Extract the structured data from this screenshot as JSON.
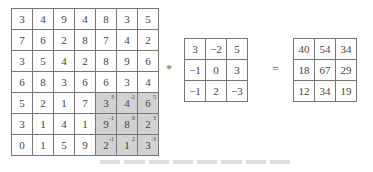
{
  "input_matrix": {
    "rows": [
      [
        3,
        4,
        9,
        4,
        8,
        3,
        5
      ],
      [
        7,
        6,
        2,
        8,
        7,
        4,
        2
      ],
      [
        3,
        5,
        4,
        2,
        8,
        9,
        6
      ],
      [
        6,
        8,
        3,
        6,
        6,
        3,
        4
      ],
      [
        5,
        2,
        1,
        7,
        3,
        4,
        6
      ],
      [
        3,
        1,
        4,
        1,
        9,
        8,
        2
      ],
      [
        0,
        1,
        5,
        9,
        2,
        1,
        3
      ]
    ],
    "highlight_region": {
      "row_start": 4,
      "col_start": 4,
      "size": 3
    },
    "highlight_color": "#d2d2d2"
  },
  "operators": {
    "convolve": "*",
    "equals": "="
  },
  "kernel": {
    "rows": [
      [
        3,
        -2,
        5
      ],
      [
        -1,
        0,
        3
      ],
      [
        -1,
        2,
        -3
      ]
    ]
  },
  "result_matrix": {
    "rows": [
      [
        40,
        54,
        34
      ],
      [
        18,
        67,
        29
      ],
      [
        12,
        34,
        19
      ]
    ]
  }
}
